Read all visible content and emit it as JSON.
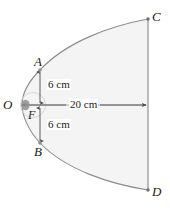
{
  "figure": {
    "colors": {
      "curve": "#8c8c8c",
      "fill": "#f4f4f4",
      "line": "#9a9a9a",
      "text": "#1a1a1a",
      "marker": "#8a8a8a",
      "focus_blob": "#8f8f8f"
    },
    "points": [
      {
        "id": "O",
        "label": "O",
        "x": 22,
        "y": 105,
        "role": "vertex"
      },
      {
        "id": "F",
        "label": "F",
        "x": 33,
        "y": 105,
        "role": "focus"
      },
      {
        "id": "A",
        "label": "A",
        "x": 40,
        "y": 70,
        "role": "latus-rectum-top"
      },
      {
        "id": "B",
        "label": "B",
        "x": 40,
        "y": 143,
        "role": "latus-rectum-bottom"
      },
      {
        "id": "C",
        "label": "C",
        "x": 148,
        "y": 19,
        "role": "aperture-top"
      },
      {
        "id": "D",
        "label": "D",
        "x": 148,
        "y": 190,
        "role": "aperture-bottom"
      }
    ],
    "dimensions": [
      {
        "id": "six-top",
        "text": "6 cm",
        "value": 6,
        "unit": "cm",
        "from": "A",
        "to": "F",
        "orientation": "vertical"
      },
      {
        "id": "six-bottom",
        "text": "6 cm",
        "value": 6,
        "unit": "cm",
        "from": "F",
        "to": "B",
        "orientation": "vertical"
      },
      {
        "id": "twenty",
        "text": "20 cm",
        "value": 20,
        "unit": "cm",
        "from": "O",
        "to": "CD",
        "orientation": "horizontal"
      }
    ]
  }
}
